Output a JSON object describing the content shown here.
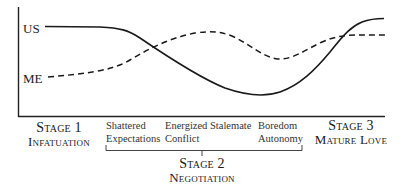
{
  "diagram": {
    "y_labels": {
      "top": "US",
      "bottom": "ME"
    },
    "series": [
      {
        "name": "US",
        "style": "solid",
        "color": "#1a1a1a"
      },
      {
        "name": "ME",
        "style": "dashed",
        "color": "#1a1a1a"
      }
    ],
    "stages": [
      {
        "title": "Stage 1",
        "subtitle": "Infatuation"
      },
      {
        "title": "Stage 2",
        "subtitle": "Negotiation"
      },
      {
        "title": "Stage 3",
        "subtitle": "Mature Love"
      }
    ],
    "negotiation_phases": [
      {
        "line1": "Shattered",
        "line2": "Expectations"
      },
      {
        "line1": "Energized",
        "line2": "Conflict"
      },
      {
        "line1": "Stalemate",
        "line2": ""
      },
      {
        "line1": "Boredom",
        "line2": "Autonomy"
      }
    ]
  }
}
